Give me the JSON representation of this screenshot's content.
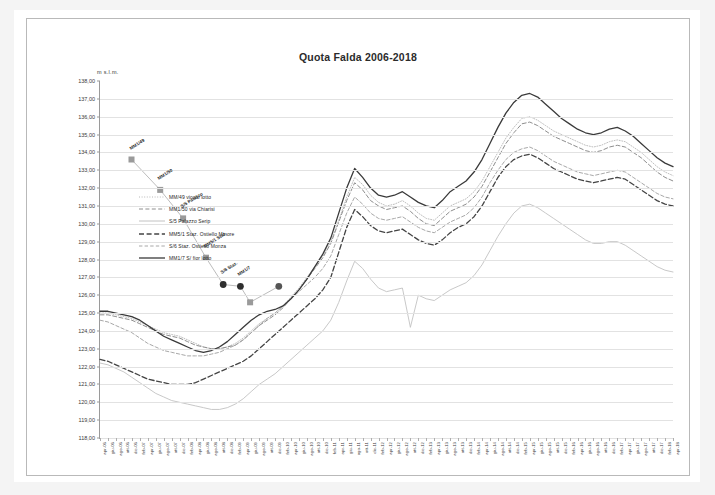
{
  "chart_data": {
    "type": "line",
    "title": "Quota Falda 2006-2018",
    "xlabel": "",
    "ylabel": "m s.l.m.",
    "ylim": [
      118.0,
      138.0
    ],
    "ytick_step": 1.0,
    "grid": true,
    "legend_position": "inside-upper-left",
    "ytick_labels": [
      "138,00",
      "137,00",
      "136,00",
      "135,00",
      "134,00",
      "133,00",
      "132,00",
      "131,00",
      "130,00",
      "129,00",
      "128,00",
      "127,00",
      "126,00",
      "125,00",
      "124,00",
      "123,00",
      "122,00",
      "121,00",
      "120,00",
      "119,00",
      "118,00"
    ],
    "categories": [
      "apr-06",
      "giu-06",
      "ago-06",
      "ott-06",
      "dic-06",
      "feb-07",
      "apr-07",
      "giu-07",
      "ago-07",
      "ott-07",
      "dic-07",
      "feb-08",
      "apr-08",
      "giu-08",
      "ago-08",
      "ott-08",
      "dic-08",
      "feb-09",
      "apr-09",
      "giu-09",
      "ago-09",
      "ott-09",
      "dic-09",
      "feb-10",
      "apr-10",
      "giu-10",
      "ago-10",
      "ott-10",
      "dic-10",
      "feb-11",
      "apr-11",
      "giu-11",
      "ago-11",
      "ott-11",
      "dic-11",
      "feb-12",
      "apr-12",
      "giu-12",
      "ago-12",
      "ott-12",
      "dic-12",
      "feb-13",
      "apr-13",
      "giu-13",
      "ago-13",
      "ott-13",
      "dic-13",
      "feb-14",
      "apr-14",
      "giu-14",
      "ago-14",
      "ott-14",
      "dic-14",
      "feb-15",
      "apr-15",
      "giu-15",
      "ago-15",
      "ott-15",
      "dic-15",
      "feb-16",
      "apr-16",
      "giu-16",
      "ago-16",
      "ott-16",
      "dic-16",
      "feb-17",
      "apr-17",
      "giu-17",
      "ago-17",
      "ott-17",
      "dic-17",
      "feb-18",
      "apr-18"
    ],
    "series": [
      {
        "name": "MM/49 vicolo lotto",
        "style": "dotted",
        "color": "#b8b8b8",
        "width": 0.9,
        "values": [
          125.0,
          125.0,
          124.9,
          124.8,
          124.7,
          124.5,
          124.3,
          124.1,
          123.9,
          123.8,
          123.7,
          123.5,
          123.3,
          123.1,
          123.0,
          123.0,
          123.1,
          123.3,
          123.6,
          124.0,
          124.4,
          124.7,
          125.0,
          125.4,
          125.9,
          126.4,
          127.0,
          127.6,
          128.2,
          129.0,
          130.2,
          131.5,
          132.6,
          132.2,
          131.6,
          131.2,
          131.0,
          131.1,
          131.3,
          131.0,
          130.6,
          130.3,
          130.2,
          130.6,
          131.0,
          131.2,
          131.4,
          131.8,
          132.4,
          133.2,
          134.0,
          134.8,
          135.4,
          135.9,
          136.0,
          135.8,
          135.5,
          135.2,
          135.0,
          134.8,
          134.6,
          134.4,
          134.3,
          134.4,
          134.6,
          134.7,
          134.6,
          134.3,
          134.0,
          133.6,
          133.2,
          132.9,
          132.7
        ]
      },
      {
        "name": "MM1/50 via Chiarisi",
        "style": "dashed",
        "color": "#8e8e8e",
        "width": 1.0,
        "values": [
          124.9,
          124.9,
          124.8,
          124.7,
          124.6,
          124.4,
          124.2,
          124.0,
          123.8,
          123.7,
          123.6,
          123.4,
          123.2,
          123.1,
          123.0,
          123.0,
          123.1,
          123.2,
          123.5,
          123.9,
          124.3,
          124.6,
          124.9,
          125.3,
          125.8,
          126.3,
          126.9,
          127.5,
          128.1,
          128.9,
          130.1,
          131.3,
          132.3,
          131.9,
          131.3,
          131.0,
          130.8,
          130.9,
          131.0,
          130.7,
          130.3,
          130.0,
          129.9,
          130.3,
          130.7,
          130.9,
          131.1,
          131.5,
          132.1,
          132.9,
          133.7,
          134.5,
          135.1,
          135.6,
          135.7,
          135.5,
          135.2,
          134.9,
          134.7,
          134.5,
          134.3,
          134.1,
          134.0,
          134.1,
          134.3,
          134.4,
          134.3,
          134.0,
          133.7,
          133.3,
          132.9,
          132.6,
          132.4
        ]
      },
      {
        "name": "S/5 Palazzo Serip",
        "style": "solid",
        "color": "#c2c2c2",
        "width": 0.9,
        "values": [
          122.2,
          122.1,
          121.9,
          121.7,
          121.4,
          121.1,
          120.8,
          120.5,
          120.3,
          120.1,
          120.0,
          119.9,
          119.8,
          119.7,
          119.6,
          119.6,
          119.7,
          119.9,
          120.2,
          120.6,
          121.0,
          121.3,
          121.6,
          122.0,
          122.4,
          122.8,
          123.2,
          123.6,
          124.0,
          124.6,
          125.6,
          126.8,
          127.9,
          127.5,
          126.9,
          126.4,
          126.2,
          126.3,
          126.4,
          124.2,
          126.0,
          125.8,
          125.7,
          126.0,
          126.3,
          126.5,
          126.7,
          127.1,
          127.7,
          128.5,
          129.3,
          130.0,
          130.6,
          131.0,
          131.1,
          130.9,
          130.6,
          130.3,
          130.0,
          129.7,
          129.4,
          129.1,
          128.9,
          128.9,
          129.0,
          129.0,
          128.8,
          128.5,
          128.2,
          127.9,
          127.6,
          127.4,
          127.3
        ]
      },
      {
        "name": "MM5/1 Staz. Ostiello Minore",
        "style": "dashed-bold",
        "color": "#444444",
        "width": 1.3,
        "values": [
          122.4,
          122.3,
          122.1,
          121.9,
          121.7,
          121.5,
          121.3,
          121.2,
          121.1,
          121.0,
          121.0,
          121.0,
          121.1,
          121.3,
          121.5,
          121.7,
          121.9,
          122.1,
          122.3,
          122.6,
          123.0,
          123.4,
          123.8,
          124.2,
          124.6,
          125.0,
          125.4,
          125.8,
          126.3,
          127.0,
          128.4,
          129.8,
          130.8,
          130.4,
          129.9,
          129.6,
          129.5,
          129.6,
          129.7,
          129.4,
          129.1,
          128.9,
          128.8,
          129.1,
          129.5,
          129.8,
          130.0,
          130.4,
          131.0,
          131.8,
          132.6,
          133.2,
          133.6,
          133.8,
          133.9,
          133.7,
          133.4,
          133.1,
          132.9,
          132.7,
          132.5,
          132.4,
          132.3,
          132.4,
          132.5,
          132.6,
          132.5,
          132.2,
          131.9,
          131.6,
          131.3,
          131.1,
          131.0
        ]
      },
      {
        "name": "S/6 Staz. Ostiello Monza",
        "style": "dashed-light",
        "color": "#a8a8a8",
        "width": 1.0,
        "values": [
          124.6,
          124.5,
          124.3,
          124.1,
          123.9,
          123.6,
          123.3,
          123.1,
          122.9,
          122.8,
          122.7,
          122.6,
          122.6,
          122.6,
          122.7,
          122.8,
          123.0,
          123.2,
          123.5,
          123.9,
          124.3,
          124.7,
          125.0,
          125.4,
          125.8,
          126.2,
          126.6,
          127.0,
          127.5,
          128.2,
          129.4,
          130.6,
          131.5,
          131.1,
          130.6,
          130.3,
          130.2,
          130.3,
          130.4,
          130.1,
          129.8,
          129.6,
          129.5,
          129.8,
          130.1,
          130.3,
          130.5,
          130.9,
          131.5,
          132.3,
          133.0,
          133.6,
          134.0,
          134.2,
          134.3,
          134.1,
          133.8,
          133.5,
          133.3,
          133.1,
          132.9,
          132.8,
          132.7,
          132.8,
          132.9,
          133.0,
          132.9,
          132.6,
          132.3,
          132.0,
          131.7,
          131.5,
          131.4
        ]
      },
      {
        "name": "MM1/7 S/ fior lotto",
        "style": "solid-bold",
        "color": "#3a3a3a",
        "width": 1.3,
        "values": [
          125.1,
          125.1,
          125.0,
          124.9,
          124.8,
          124.6,
          124.3,
          124.0,
          123.7,
          123.5,
          123.3,
          123.1,
          122.9,
          122.8,
          122.9,
          123.1,
          123.4,
          123.8,
          124.2,
          124.6,
          124.9,
          125.1,
          125.2,
          125.4,
          125.8,
          126.3,
          126.9,
          127.6,
          128.3,
          129.2,
          130.6,
          132.0,
          133.1,
          132.6,
          132.0,
          131.6,
          131.5,
          131.6,
          131.8,
          131.5,
          131.2,
          131.0,
          130.9,
          131.3,
          131.8,
          132.1,
          132.4,
          132.9,
          133.6,
          134.5,
          135.4,
          136.2,
          136.8,
          137.2,
          137.3,
          137.1,
          136.7,
          136.3,
          135.9,
          135.6,
          135.3,
          135.1,
          135.0,
          135.1,
          135.3,
          135.4,
          135.2,
          134.9,
          134.5,
          134.1,
          133.7,
          133.4,
          133.2
        ]
      }
    ],
    "annotation_series": {
      "name": "livelli storici",
      "points": [
        {
          "label": "MM1/49",
          "x": 0.055,
          "y": 133.6,
          "marker": "square",
          "color": "#9a9a9a"
        },
        {
          "label": "MM1/50",
          "x": 0.105,
          "y": 131.9,
          "marker": "square",
          "color": "#9a9a9a"
        },
        {
          "label": "S/5 Palazzo",
          "x": 0.145,
          "y": 130.3,
          "marker": "square",
          "color": "#9a9a9a"
        },
        {
          "label": "MM5/1 Staz.",
          "x": 0.185,
          "y": 128.1,
          "marker": "square",
          "color": "#9a9a9a"
        },
        {
          "label": "S/6 Staz.",
          "x": 0.215,
          "y": 126.6,
          "marker": "circle",
          "color": "#2e2e2e"
        },
        {
          "label": "MM1/7",
          "x": 0.245,
          "y": 126.5,
          "marker": "circle",
          "color": "#2e2e2e"
        },
        {
          "label": "",
          "x": 0.262,
          "y": 125.6,
          "marker": "square",
          "color": "#9a9a9a"
        },
        {
          "label": "",
          "x": 0.312,
          "y": 126.5,
          "marker": "circle",
          "color": "#555555"
        }
      ],
      "text_labels": [
        "MM1/49",
        "MM1/50 via",
        "S/5 Palazzo"
      ]
    }
  }
}
